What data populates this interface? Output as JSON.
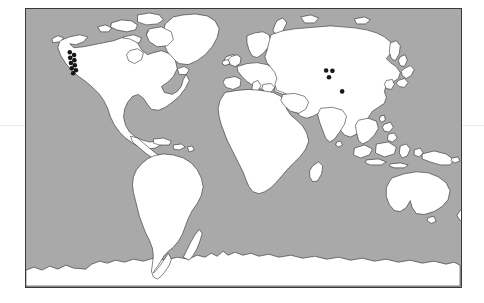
{
  "figure": {
    "type": "world-distribution-map",
    "projection": "equirectangular",
    "title": "",
    "caption": ""
  },
  "canvas": {
    "width": 484,
    "height": 303,
    "background_color": "#ffffff"
  },
  "map": {
    "frame": {
      "x": 25,
      "y": 8,
      "width": 437,
      "height": 280
    },
    "ocean_color": "#a9a9a9",
    "land_color": "#ffffff",
    "coastline_color": "#1d1d1d",
    "border_color": "#3a3a3a",
    "lon_range": [
      -180,
      180
    ],
    "lat_range": [
      -90,
      90
    ]
  },
  "guides": {
    "equator": {
      "label": "",
      "y": 125,
      "color": "#e9e9e9",
      "visible": true
    },
    "right_tick": {
      "x": 455,
      "y": 126,
      "color": "#6d6d6d",
      "visible": true
    }
  },
  "legend": {
    "visible": false,
    "entries": [
      {
        "symbol": "filled-circle",
        "color": "#181818",
        "label": ""
      }
    ]
  },
  "chart_data": {
    "type": "scatter",
    "title": "",
    "xlabel": "Longitude",
    "ylabel": "Latitude",
    "xlim": [
      -180,
      180
    ],
    "ylim": [
      -90,
      90
    ],
    "grid": false,
    "marker": {
      "shape": "circle",
      "color": "#181818",
      "size_px": 4.6
    },
    "clusters": [
      {
        "name": "western-north-america",
        "count": 9,
        "points": [
          {
            "lon": -123.0,
            "lat": 49.2
          },
          {
            "lon": -119.5,
            "lat": 47.3
          },
          {
            "lon": -122.6,
            "lat": 45.5
          },
          {
            "lon": -119.2,
            "lat": 44.0
          },
          {
            "lon": -122.0,
            "lat": 42.1
          },
          {
            "lon": -118.8,
            "lat": 40.6
          },
          {
            "lon": -121.3,
            "lat": 38.8
          },
          {
            "lon": -117.8,
            "lat": 37.4
          },
          {
            "lon": -120.1,
            "lat": 35.0
          }
        ]
      },
      {
        "name": "east-asia",
        "count": 4,
        "points": [
          {
            "lon": 104.5,
            "lat": 36.8
          },
          {
            "lon": 109.8,
            "lat": 36.6
          },
          {
            "lon": 107.0,
            "lat": 32.4
          },
          {
            "lon": 117.2,
            "lat": 26.8
          }
        ]
      }
    ],
    "total_points": 13
  },
  "continents": [
    {
      "name": "north-america"
    },
    {
      "name": "greenland"
    },
    {
      "name": "south-america"
    },
    {
      "name": "europe"
    },
    {
      "name": "africa"
    },
    {
      "name": "asia"
    },
    {
      "name": "australia"
    },
    {
      "name": "new-zealand"
    },
    {
      "name": "southeast-asia-archipelago"
    },
    {
      "name": "japan"
    },
    {
      "name": "madagascar"
    },
    {
      "name": "british-isles"
    },
    {
      "name": "antarctica"
    },
    {
      "name": "iceland"
    },
    {
      "name": "arctic-archipelago"
    }
  ]
}
